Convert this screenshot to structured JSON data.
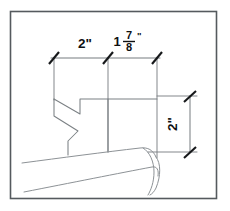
{
  "drawing": {
    "title": "Dimensioned tool profile sketch",
    "canvas": {
      "width": 230,
      "height": 211
    },
    "frame": {
      "x": 10,
      "y": 11,
      "width": 207,
      "height": 188,
      "color": "#555a5e"
    },
    "colors": {
      "background": "#ffffff",
      "frame_stroke": "#555a5e",
      "object_stroke": "#7b8084",
      "dimension_stroke": "#6e7478",
      "tick_stroke": "#16181a",
      "text": "#0e1012"
    },
    "dimensions": [
      {
        "id": "horizontal-left",
        "label": "2\"",
        "value": 2,
        "unit": "inch",
        "orientation": "horizontal",
        "display_kind": "plain"
      },
      {
        "id": "horizontal-right",
        "label": "1 7/8\"",
        "whole": "1",
        "numerator": "7",
        "denominator": "8",
        "inch_mark": "\"",
        "value": 1.875,
        "unit": "inch",
        "orientation": "horizontal",
        "display_kind": "stacked-fraction"
      },
      {
        "id": "vertical-right",
        "label": "2\"",
        "value": 2,
        "unit": "inch",
        "orientation": "vertical",
        "rotation_degrees": -90,
        "display_kind": "plain"
      }
    ],
    "features": {
      "profile_name": "v-notch-blade-profile",
      "blade_name": "angled-blade-body",
      "tick_style": "architectural-slash"
    }
  }
}
